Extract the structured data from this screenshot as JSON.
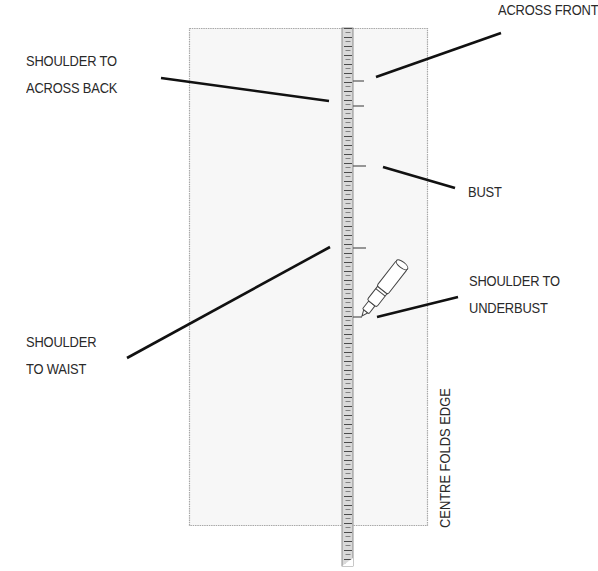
{
  "diagram": {
    "type": "sewing-pattern-measurement",
    "colors": {
      "fabric_fill": "#f7f7f7",
      "fabric_border": "#a8a8a8",
      "ruler_fill": "#d9d9d9",
      "ruler_ticks": "#4a4a4a",
      "leader_lines": "#111111",
      "text": "#2a2a2a"
    },
    "labels": {
      "across_front": {
        "lines": [
          "ACROSS FRONT"
        ]
      },
      "shoulder_to_across_back": {
        "lines": [
          "SHOULDER TO",
          "ACROSS BACK"
        ]
      },
      "bust": {
        "lines": [
          "BUST"
        ]
      },
      "shoulder_to_underbust": {
        "lines": [
          "SHOULDER TO",
          "UNDERBUST"
        ]
      },
      "shoulder_to_waist": {
        "lines": [
          "SHOULDER",
          "TO WAIST"
        ]
      },
      "centre_folds_edge": {
        "text": "CENTRE FOLDS EDGE"
      }
    },
    "marks_y": [
      81,
      106,
      166,
      248,
      317
    ],
    "elements": [
      "fabric-rectangle",
      "measuring-tape",
      "pen"
    ]
  }
}
